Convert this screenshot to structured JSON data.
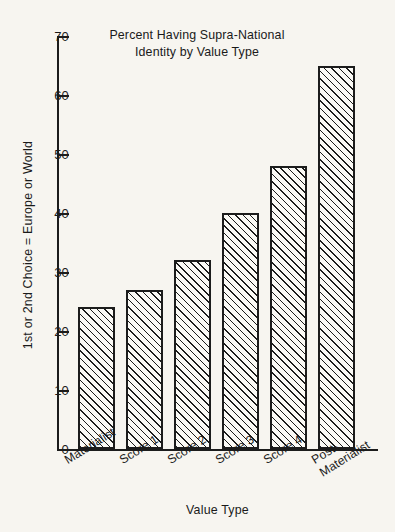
{
  "chart_data": {
    "type": "bar",
    "title": "Percent Having Supra-National Identity by Value Type",
    "title_line1": "Percent Having Supra-National",
    "title_line2": "Identity by Value Type",
    "xlabel": "Value Type",
    "ylabel": "1st or 2nd Choice = Europe or World",
    "categories": [
      "Materialist",
      "Score 1",
      "Score 2",
      "Score 3",
      "Score 4",
      "Post-Materialist"
    ],
    "category_lines": [
      [
        "Materialist"
      ],
      [
        "Score 1"
      ],
      [
        "Score 2"
      ],
      [
        "Score 3"
      ],
      [
        "Score 4"
      ],
      [
        "Post-",
        "Materialist"
      ]
    ],
    "values": [
      24,
      27,
      32,
      40,
      48,
      65
    ],
    "ylim": [
      0,
      70
    ],
    "yticks": [
      0,
      10,
      20,
      30,
      40,
      50,
      60,
      70
    ],
    "ytick_labels": [
      "0",
      "10",
      "20",
      "30",
      "40",
      "50",
      "60",
      "70"
    ],
    "grid": false,
    "legend": false,
    "bar_fill": "diagonal-hatch",
    "colors": {
      "background": "#f7f5f0",
      "ink": "#1c1c1c",
      "bar_face": "#fbfaf6"
    }
  }
}
